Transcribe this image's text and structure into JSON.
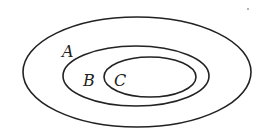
{
  "diagram": {
    "type": "nested-sets-venn",
    "sets": [
      {
        "label": "A",
        "contains": "B"
      },
      {
        "label": "B",
        "contains": "C"
      },
      {
        "label": "C"
      }
    ],
    "stroke_color": "#222222",
    "background": "#ffffff"
  }
}
